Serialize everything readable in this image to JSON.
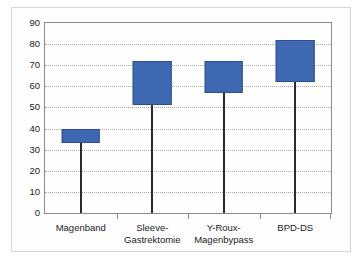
{
  "chart_data": {
    "type": "bar",
    "subtype": "floating-range-bar",
    "title": "",
    "subtitle": "",
    "xlabel": "",
    "ylabel": "",
    "ylim": [
      0,
      90
    ],
    "ytick_step": 10,
    "yticks": [
      0,
      10,
      20,
      30,
      40,
      50,
      60,
      70,
      80,
      90
    ],
    "ytick_labels": [
      "0",
      "10",
      "20",
      "30",
      "40",
      "50",
      "60",
      "70",
      "80",
      "90"
    ],
    "grid": true,
    "grid_style": "dotted-horizontal",
    "legend": false,
    "legend_position": "none",
    "categories": [
      "Magenband",
      "Sleeve-Gastrektomie",
      "Y-Roux-Magenbypass",
      "BPD-DS"
    ],
    "category_label_lines": [
      [
        "Magenband"
      ],
      [
        "Sleeve-",
        "Gastrektomie"
      ],
      [
        "Y-Roux-",
        "Magenbypass"
      ],
      [
        "BPD-DS"
      ]
    ],
    "series": [
      {
        "name": "Bereich",
        "low": [
          33,
          51,
          57,
          62
        ],
        "high": [
          40,
          72,
          72,
          82
        ]
      }
    ],
    "bar_color": "#3f68b2",
    "bar_edge_color": "#2f4f8a",
    "drop_line_color": "#2b2b2b",
    "axis_color": "#8d8d8d",
    "grid_color": "#a8a8a8",
    "text_color": "#1b1b1b",
    "background": "#ffffff"
  }
}
